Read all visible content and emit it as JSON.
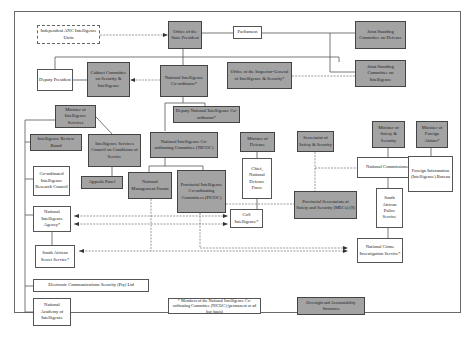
{
  "diagram": {
    "colors": {
      "oversight_fill": "#a3a3a3",
      "other_fill": "#ffffff",
      "line": "#555555"
    },
    "nodes": {
      "anc_units": "Independent ANC Intelligence Units",
      "state_president": "Office of the State President",
      "parliament": "Parliament",
      "jsc_defence": "Joint Standing Committee on Defence",
      "jsc_intelligence": "Joint Standing Committee on Intelligence",
      "deputy_president": "Deputy President",
      "cabinet_committee": "Cabinet Committee on Security & Intelligence",
      "nat_coordinator": "National Intelligence Co-ordinator*",
      "inspector_general": "Office of the Inspector-General of Intelligence & Security*",
      "minister_intel": "Minister of Intelligence Services",
      "deputy_coordinator": "Deputy National Intelligence Co-ordinator*",
      "review_board": "Intelligence Review Board",
      "services_council": "Intelligence Services Council on Conditions of Service",
      "nicoc": "National Intelligence Co-ordinating Committee (NICOC)",
      "minister_defence": "Minister of Defence",
      "secretariat": "Secretariat of Safety & Security",
      "minister_safety": "Minister of Safety & Security",
      "minister_foreign": "Minister of Foreign Affairs*",
      "research_council": "Co-ordinated Intelligence Research Council",
      "appeals_panel": "Appeals Panel",
      "mgmt_forum": "National Management Forum",
      "picoc": "Provincial Intelligence Co-ordinating Committees (PICOC)",
      "sandf_chief": "Chief, National Defence Force",
      "nat_commissioner": "National Commissioner",
      "fib": "Foreign Information (Intelligence) Bureau",
      "mecs": "Provincial Secretariats of Safety and Security (MECs) (9)",
      "saps": "South African Police Service",
      "nia": "National Intelligence Agency*",
      "cos_intel": "CoS Intelligence*",
      "sass": "South African Secret Service*",
      "ncis": "National Crime Investigation Service*",
      "comsec": "Electronic Communications Security (Pty) Ltd",
      "academy": "National Academy of Intelligence"
    },
    "legend": {
      "footnote": "* Members of the National Intelligence Co-ordinating Committee (NICOC) (permanent or ad hoc basis)",
      "grey_key": "Oversight and Accountability Structures"
    }
  }
}
